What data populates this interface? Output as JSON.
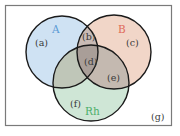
{
  "diagram": {
    "type": "venn",
    "frame": {
      "stroke": "#7a7a7a"
    },
    "sets": [
      {
        "id": "A",
        "label": "A",
        "color": "#5aa0d8",
        "fill": "#cfe2f3",
        "label_color": "#5b9bd5"
      },
      {
        "id": "B",
        "label": "B",
        "color": "#e06050",
        "fill": "#f3d3c4",
        "label_color": "#e06a5a"
      },
      {
        "id": "Rh",
        "label": "Rh",
        "color": "#4a9a60",
        "fill": "#cfe6d6",
        "label_color": "#4caf6a"
      }
    ],
    "regions": {
      "a": "(a)",
      "b": "(b)",
      "c": "(c)",
      "d": "(d)",
      "e": "(e)",
      "f": "(f)",
      "g": "(g)"
    }
  }
}
